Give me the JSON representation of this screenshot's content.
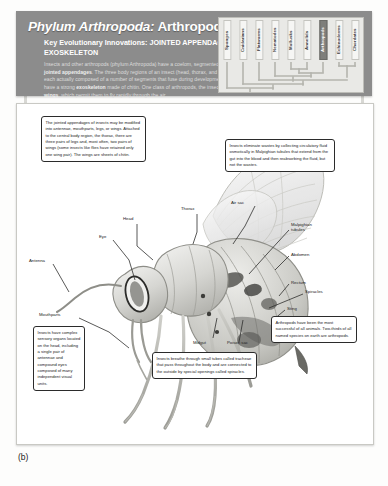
{
  "figure": {
    "caption": "(b)"
  },
  "banner": {
    "title_italic": "Phylum Arthropoda:",
    "title_rest": " Arthropods",
    "subtitle": "Key Evolutionary Innovations: JOINTED APPENDAGES and EXOSKELETON",
    "body_html": "Insects and other arthropods (phylum Arthropoda) have a coelom, segmented bodies, and jointed appendages. The three body regions of an insect (head, thorax, and abdomen) are each actually composed of a number of segments that fuse during development. All arthropods have a strong exoskeleton made of chitin. One class of arthropods, the insects, has evolved wings, which permit them to fly rapidly through the air.",
    "bold_terms": [
      "jointed appendages",
      "exoskeleton",
      "wings"
    ]
  },
  "cladogram": {
    "taxa": [
      {
        "label": "Sponges",
        "highlighted": false
      },
      {
        "label": "Cnidarians",
        "highlighted": false
      },
      {
        "label": "Flatworms",
        "highlighted": false
      },
      {
        "label": "Nematodes",
        "highlighted": false
      },
      {
        "label": "Mollusks",
        "highlighted": false
      },
      {
        "label": "Annelids",
        "highlighted": false
      },
      {
        "label": "Arthropods",
        "highlighted": true
      },
      {
        "label": "Echinoderms",
        "highlighted": false
      },
      {
        "label": "Chordates",
        "highlighted": false
      }
    ]
  },
  "callouts": [
    {
      "id": "appendages",
      "text": "The jointed appendages of insects may be modified into antennae, mouthparts, legs, or wings. Attached to the central body region, the thorax, there are three pairs of legs and, most often, two pairs of wings (some insects like flies have retained only one wing pair). The wings are sheets of chitin."
    },
    {
      "id": "malpighian",
      "text": "Insects eliminate wastes by collecting circulatory fluid osmotically in Malpighian tubules that extend from the gut into the blood and then reabsorbing the fluid, but not the wastes."
    },
    {
      "id": "sensory",
      "text": "Insects have complex sensory organs located on the head, including a single pair of antennae and compound eyes composed of many independent visual units."
    },
    {
      "id": "tracheae",
      "text": "Insects breathe through small tubes called tracheae that pass throughout the body and are connected to the outside by special openings called spiracles."
    },
    {
      "id": "success",
      "text": "Arthropods have been the most successful of all animals. Two-thirds of all named species on earth are arthropods."
    }
  ],
  "anatomy_labels": [
    {
      "id": "head",
      "label": "Head"
    },
    {
      "id": "thorax",
      "label": "Thorax"
    },
    {
      "id": "eye",
      "label": "Eye"
    },
    {
      "id": "antenna",
      "label": "Antenna"
    },
    {
      "id": "mouthparts",
      "label": "Mouthparts"
    },
    {
      "id": "spiracles",
      "label": "Spiracles"
    },
    {
      "id": "air-sac",
      "label": "Air sac"
    },
    {
      "id": "malpighian-tubules",
      "label": "Malpighian tubules"
    },
    {
      "id": "abdomen",
      "label": "Abdomen"
    },
    {
      "id": "rectum",
      "label": "Rectum"
    },
    {
      "id": "sting",
      "label": "Sting"
    },
    {
      "id": "midgut",
      "label": "Midgut"
    },
    {
      "id": "poison-sac",
      "label": "Poison sac"
    }
  ],
  "colors": {
    "banner_bg": "#8c8c8c",
    "highlight": "#7e7e7a",
    "panel_bg": "#ffffff",
    "page_bg": "#fdfdfc"
  }
}
